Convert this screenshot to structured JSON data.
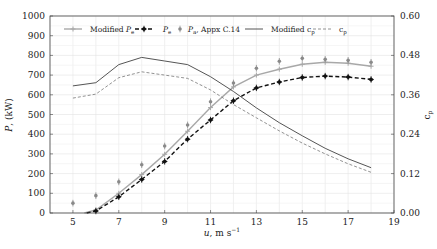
{
  "chart_data": {
    "type": "line",
    "title": "",
    "xlabel": "u, m s^-1",
    "ylabel": "P, (kW)",
    "y2label": "c_p",
    "xlim": [
      4,
      19
    ],
    "ylim": [
      0,
      1000
    ],
    "y2lim": [
      0,
      0.6
    ],
    "grid": true,
    "legend_position": "top-inside",
    "x_ticks": [
      5,
      7,
      9,
      11,
      13,
      15,
      17,
      19
    ],
    "y_ticks": [
      0,
      100,
      200,
      300,
      400,
      500,
      600,
      700,
      800,
      900,
      1000
    ],
    "y2_ticks": [
      "0.00",
      "0.12",
      "0.24",
      "0.36",
      "0.48",
      "0.60"
    ],
    "series": [
      {
        "name": "Modified P_e",
        "axis": "left",
        "style": "solid-grey-plus",
        "color": "#a8a8a8",
        "x": [
          5.5,
          6,
          7,
          8,
          9,
          10,
          11,
          12,
          13,
          14,
          15,
          16,
          17,
          18
        ],
        "values": [
          0,
          15,
          100,
          195,
          298,
          415,
          535,
          640,
          700,
          730,
          755,
          765,
          760,
          745
        ]
      },
      {
        "name": "P_e",
        "axis": "left",
        "style": "dashed-black-diamond",
        "color": "#111111",
        "x": [
          5.6,
          6,
          7,
          8,
          9,
          10,
          11,
          12,
          13,
          14,
          15,
          16,
          17,
          18
        ],
        "values": [
          0,
          10,
          82,
          170,
          262,
          375,
          472,
          570,
          635,
          665,
          688,
          695,
          690,
          678
        ]
      },
      {
        "name": "P_a, Appx C.14",
        "axis": "left",
        "style": "markers-grey-star",
        "color": "#8a8a8a",
        "x": [
          5,
          6,
          7,
          8,
          9,
          10,
          11,
          12,
          13,
          14,
          15,
          16,
          17,
          18
        ],
        "values": [
          50,
          88,
          158,
          245,
          340,
          447,
          565,
          660,
          735,
          770,
          785,
          780,
          775,
          765
        ]
      },
      {
        "name": "Modified c_p",
        "axis": "right",
        "style": "solid-dark",
        "color": "#555555",
        "x": [
          5,
          6,
          7,
          8,
          9,
          10,
          11,
          12,
          13,
          14,
          15,
          16,
          17,
          18
        ],
        "values": [
          0.387,
          0.397,
          0.452,
          0.474,
          0.463,
          0.452,
          0.415,
          0.37,
          0.32,
          0.275,
          0.235,
          0.197,
          0.165,
          0.138
        ]
      },
      {
        "name": "c_p",
        "axis": "right",
        "style": "dashed-thin",
        "color": "#777777",
        "x": [
          5,
          6,
          7,
          8,
          9,
          10,
          11,
          12,
          13,
          14,
          15,
          16,
          17,
          18
        ],
        "values": [
          0.35,
          0.362,
          0.412,
          0.43,
          0.42,
          0.41,
          0.375,
          0.33,
          0.29,
          0.25,
          0.213,
          0.18,
          0.15,
          0.124
        ]
      }
    ]
  },
  "legend": {
    "items": [
      {
        "label": "Modified ",
        "sub": "P",
        "suffix": "e"
      },
      {
        "label": "",
        "sub": "P",
        "suffix": "e"
      },
      {
        "label": "",
        "sub": "P",
        "suffix": "a",
        "tail": ", Appx C.14"
      },
      {
        "label": "Modified c",
        "suffix": "p"
      },
      {
        "label": "c",
        "suffix": "p"
      }
    ]
  },
  "axes": {
    "xlabel_main": "u, m s",
    "xlabel_sup": "−1",
    "ylabel_main": "P",
    "ylabel_rest": ", (kW)",
    "y2label_main": "c",
    "y2label_sub": "p"
  }
}
